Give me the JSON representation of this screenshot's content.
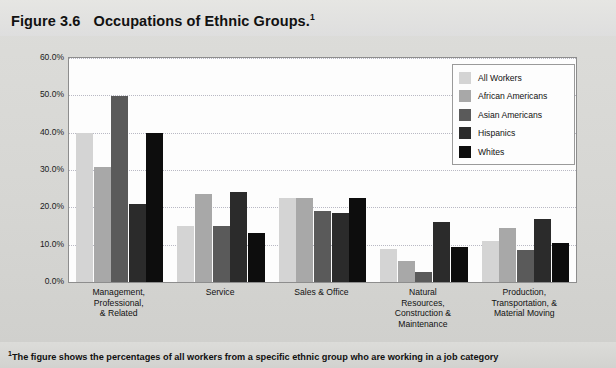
{
  "figure": {
    "number": "Figure 3.6",
    "title": "Occupations of Ethnic Groups.",
    "title_superscript": "1",
    "footnote_marker": "1",
    "footnote": "The figure shows the percentages of all workers from a specific ethnic group who are working in a job category"
  },
  "chart_data": {
    "type": "bar",
    "title": "Occupations of Ethnic Groups.",
    "xlabel": "",
    "ylabel": "",
    "ylim": [
      0,
      60
    ],
    "ytick_labels": [
      "0.0%",
      "10.0%",
      "20.0%",
      "30.0%",
      "40.0%",
      "50.0%",
      "60.0%"
    ],
    "ytick_values": [
      0,
      10,
      20,
      30,
      40,
      50,
      60
    ],
    "grid": true,
    "legend_position": "top-right",
    "categories": [
      "Management, Professional, & Related",
      "Service",
      "Sales & Office",
      "Natural Resources, Construction & Maintenance",
      "Production, Transportation, & Material Moving"
    ],
    "category_lines": [
      [
        "Management,",
        "Professional,",
        "& Related"
      ],
      [
        "Service"
      ],
      [
        "Sales & Office"
      ],
      [
        "Natural",
        "Resources,",
        "Construction &",
        "Maintenance"
      ],
      [
        "Production,",
        "Transportation, &",
        "Material Moving"
      ]
    ],
    "series": [
      {
        "name": "All Workers",
        "color": "#d4d4d4",
        "values": [
          39.8,
          15.0,
          22.5,
          8.8,
          11.0
        ]
      },
      {
        "name": "African Americans",
        "color": "#a8a8a8",
        "values": [
          30.8,
          23.5,
          22.4,
          5.5,
          14.5
        ]
      },
      {
        "name": "Asian Americans",
        "color": "#5a5a5a",
        "values": [
          49.8,
          15.1,
          19.0,
          2.6,
          8.5
        ]
      },
      {
        "name": "Hispanics",
        "color": "#2b2b2b",
        "values": [
          20.8,
          24.2,
          18.6,
          16.0,
          17.0
        ]
      },
      {
        "name": "Whites",
        "color": "#0d0d0d",
        "values": [
          39.9,
          13.2,
          22.4,
          9.5,
          10.5
        ]
      }
    ]
  }
}
